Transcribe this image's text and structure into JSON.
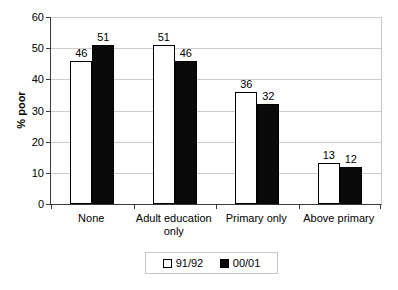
{
  "chart_data": {
    "type": "bar",
    "title": "",
    "xlabel": "",
    "ylabel": "% poor",
    "ylim": [
      0,
      60
    ],
    "yticks": [
      0,
      10,
      20,
      30,
      40,
      50,
      60
    ],
    "grid": "horizontal",
    "legend_position": "bottom-center",
    "categories": [
      "None",
      "Adult education only",
      "Primary only",
      "Above primary"
    ],
    "series": [
      {
        "name": "91/92",
        "color": "#ffffff",
        "values": [
          46,
          51,
          36,
          13
        ]
      },
      {
        "name": "00/01",
        "color": "#0a0a0a",
        "values": [
          51,
          46,
          32,
          12
        ]
      }
    ]
  },
  "colors": {
    "background": "#ffffff",
    "gridline": "#cccccc",
    "axis": "#3a3a3a",
    "bar_border": "#000000",
    "legend_border": "#c6c6c6"
  }
}
